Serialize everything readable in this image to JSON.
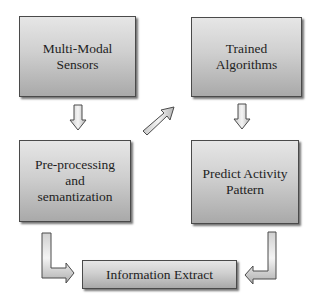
{
  "diagram": {
    "nodes": [
      {
        "id": "sensors",
        "lines": [
          "Multi-Modal",
          "Sensors"
        ]
      },
      {
        "id": "preprocessing",
        "lines": [
          "Pre-processing",
          "and",
          "semantization"
        ]
      },
      {
        "id": "trained",
        "lines": [
          "Trained",
          "Algorithms"
        ]
      },
      {
        "id": "predict",
        "lines": [
          "Predict Activity",
          "Pattern"
        ]
      },
      {
        "id": "extract",
        "lines": [
          "Information Extract"
        ]
      }
    ],
    "edges": [
      {
        "from": "sensors",
        "to": "preprocessing",
        "direction": "down"
      },
      {
        "from": "preprocessing",
        "to": "trained",
        "direction": "diagonal-up-right"
      },
      {
        "from": "trained",
        "to": "predict",
        "direction": "down"
      },
      {
        "from": "preprocessing",
        "to": "extract",
        "direction": "down-then-right"
      },
      {
        "from": "predict",
        "to": "extract",
        "direction": "down-then-left"
      }
    ],
    "colors": {
      "box_top": "#e6e6e6",
      "box_bottom": "#a9a9a9",
      "border": "#4a4a4a",
      "text": "#1e1e1e"
    }
  }
}
